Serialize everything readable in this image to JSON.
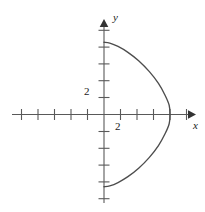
{
  "figure": {
    "name": "cartesian-plot",
    "width": 205,
    "height": 212,
    "background": "#ffffff",
    "stroke_color": "#4d4d4d",
    "axis_color": "#595959",
    "text_color": "#1a1a1a"
  },
  "axes": {
    "x": {
      "label": "x",
      "label_style": "italic",
      "tick_label": "2",
      "tick_label_value": 2,
      "ticks": [
        -5,
        -4,
        -3,
        -2,
        -1,
        1,
        2,
        3,
        4,
        5
      ],
      "range": [
        -6,
        6
      ],
      "arrow": "right"
    },
    "y": {
      "label": "y",
      "label_style": "italic",
      "tick_label": "2",
      "tick_label_value": 2,
      "ticks": [
        -5,
        -4,
        -3,
        -2,
        -1,
        1,
        2,
        3,
        4,
        5
      ],
      "range": [
        -6,
        6
      ],
      "arrow": "up"
    }
  },
  "chart_data": {
    "type": "line",
    "title": "",
    "xlabel": "x",
    "ylabel": "y",
    "xlim": [
      -6,
      6
    ],
    "ylim": [
      -6,
      6
    ],
    "grid": false,
    "legend": null,
    "series": [
      {
        "name": "closed-curve",
        "description": "Closed curve in the right half-plane, symmetric about the x-axis; passes through (0, 4.3), reaches maximum x at approximately (4.0, 0), and returns to (0, -4.3)",
        "closed_on_axis": true,
        "x": [
          0.0,
          0.35,
          0.85,
          1.45,
          2.1,
          2.75,
          3.3,
          3.7,
          3.95,
          4.0,
          3.95,
          3.7,
          3.3,
          2.75,
          2.1,
          1.45,
          0.85,
          0.35,
          0.0
        ],
        "y": [
          4.3,
          4.25,
          4.05,
          3.7,
          3.2,
          2.55,
          1.85,
          1.15,
          0.55,
          0.0,
          -0.55,
          -1.15,
          -1.85,
          -2.55,
          -3.2,
          -3.7,
          -4.05,
          -4.25,
          -4.3
        ]
      }
    ],
    "annotations": [
      {
        "text": "2",
        "axis": "y",
        "value": 2
      },
      {
        "text": "2",
        "axis": "x",
        "value": 2
      }
    ]
  }
}
